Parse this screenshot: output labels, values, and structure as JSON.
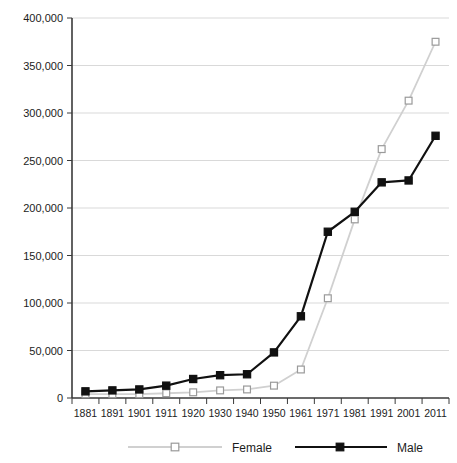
{
  "chart_data": {
    "type": "line",
    "title": "",
    "xlabel": "",
    "ylabel": "",
    "grid": true,
    "legend_position": "bottom",
    "categories": [
      "1881",
      "1891",
      "1901",
      "1911",
      "1920",
      "1930",
      "1940",
      "1950",
      "1961",
      "1971",
      "1981",
      "1991",
      "2001",
      "2011"
    ],
    "ylim": [
      0,
      400000
    ],
    "yticks": [
      0,
      50000,
      100000,
      150000,
      200000,
      250000,
      300000,
      350000,
      400000
    ],
    "ytick_labels": [
      "0",
      "50,000",
      "100,000",
      "150,000",
      "200,000",
      "250,000",
      "300,000",
      "350,000",
      "400,000"
    ],
    "series": [
      {
        "name": "Female",
        "color": "#d0d0d0",
        "marker": "open-square",
        "marker_fill": "#ffffff",
        "marker_stroke": "#9a9a9a",
        "values": [
          4000,
          4000,
          4000,
          5000,
          6000,
          8000,
          9000,
          13000,
          30000,
          105000,
          188000,
          262000,
          313000,
          375000
        ]
      },
      {
        "name": "Male",
        "color": "#111111",
        "marker": "filled-square",
        "marker_fill": "#111111",
        "marker_stroke": "#111111",
        "values": [
          7000,
          8000,
          9000,
          13000,
          20000,
          24000,
          25000,
          48000,
          86000,
          175000,
          196000,
          227000,
          229000,
          276000
        ]
      }
    ]
  },
  "legend": {
    "items": [
      {
        "label": "Female"
      },
      {
        "label": "Male"
      }
    ]
  }
}
